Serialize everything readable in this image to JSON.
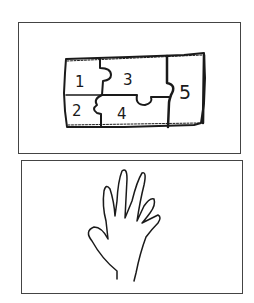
{
  "panels": [
    {
      "id": "puzzle-sketch",
      "description": "hand-drawn rectangle divided into 5 jigsaw pieces",
      "pieces": [
        {
          "label": "1"
        },
        {
          "label": "2"
        },
        {
          "label": "3"
        },
        {
          "label": "4"
        },
        {
          "label": "5"
        }
      ]
    },
    {
      "id": "hand-drawing",
      "description": "outline of an open hand with fingers spread"
    }
  ],
  "colors": {
    "stroke": "#1a1a1a",
    "border": "#444444",
    "background": "#ffffff"
  }
}
